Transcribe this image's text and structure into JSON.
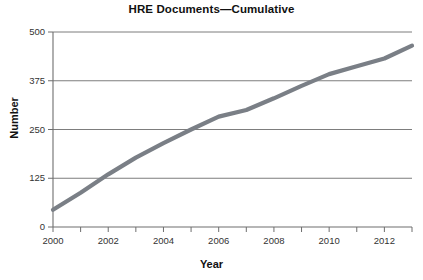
{
  "chart_data": {
    "type": "line",
    "title": "HRE Documents—Cumulative",
    "xlabel": "Year",
    "ylabel": "Number",
    "xlim": [
      2000,
      2013
    ],
    "ylim": [
      0,
      500
    ],
    "grid": true,
    "legend": "none",
    "yticks": [
      0,
      125,
      250,
      375,
      500
    ],
    "ytick_labels": [
      "0",
      "125",
      "250",
      "375",
      "500"
    ],
    "xticks": [
      2000,
      2001,
      2002,
      2003,
      2004,
      2005,
      2006,
      2007,
      2008,
      2009,
      2010,
      2011,
      2012,
      2013
    ],
    "xtick_labels": [
      "2000",
      "",
      "2002",
      "",
      "2004",
      "",
      "2006",
      "",
      "2008",
      "",
      "2010",
      "",
      "2012",
      ""
    ],
    "series": [
      {
        "name": "HRE Documents Cumulative",
        "color": "#7a7f86",
        "x": [
          2000,
          2001,
          2002,
          2003,
          2004,
          2005,
          2006,
          2007,
          2008,
          2009,
          2010,
          2011,
          2012,
          2013
        ],
        "values": [
          44,
          88,
          135,
          178,
          215,
          250,
          283,
          300,
          330,
          362,
          392,
          412,
          432,
          465
        ]
      }
    ]
  },
  "style": {
    "line_color": "#7a7f86",
    "grid_color": "#6e6e6e",
    "axis_color": "#6e6e6e",
    "text_color": "#111111",
    "background": "#ffffff"
  }
}
